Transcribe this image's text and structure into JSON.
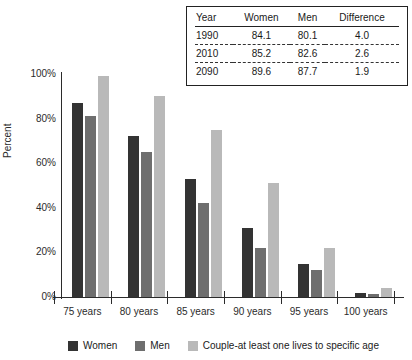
{
  "table": {
    "columns": [
      "Year",
      "Women",
      "Men",
      "Difference"
    ],
    "rows": [
      {
        "year": "1990",
        "women": "84.1",
        "men": "80.1",
        "difference": "4.0"
      },
      {
        "year": "2010",
        "women": "85.2",
        "men": "82.6",
        "difference": "2.6"
      },
      {
        "year": "2090",
        "women": "89.6",
        "men": "87.7",
        "difference": "1.9"
      }
    ]
  },
  "chart_data": {
    "type": "bar",
    "title": "",
    "xlabel": "",
    "ylabel": "Percent",
    "ylim": [
      0,
      100
    ],
    "ytick_labels": [
      "100%",
      "80%",
      "60%",
      "40%",
      "20%",
      "0%"
    ],
    "ytick_values": [
      100,
      80,
      60,
      40,
      20,
      0
    ],
    "grid": false,
    "legend_position": "bottom",
    "categories": [
      "75 years",
      "80 years",
      "85 years",
      "90 years",
      "95 years",
      "100 years"
    ],
    "series": [
      {
        "name": "Women",
        "color": "#333333",
        "values": [
          87,
          72,
          53,
          31,
          15,
          2
        ]
      },
      {
        "name": "Men",
        "color": "#6e6e6e",
        "values": [
          81,
          65,
          42,
          22,
          12,
          1.5
        ]
      },
      {
        "name": "Couple-at least one lives to specific age",
        "color": "#b9b9b9",
        "values": [
          99,
          90,
          75,
          51,
          22,
          4
        ]
      }
    ]
  }
}
